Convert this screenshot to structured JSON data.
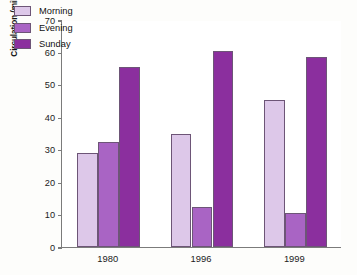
{
  "chart_data": {
    "type": "bar",
    "title": "",
    "subtitle": "",
    "xlabel": "",
    "ylabel": "Circulation (millions)",
    "categories": [
      "1980",
      "1996",
      "1999"
    ],
    "series": [
      {
        "name": "Morning",
        "color": "#ddc8e9",
        "values": [
          29.0,
          35.0,
          45.3
        ]
      },
      {
        "name": "Evening",
        "color": "#a964c4",
        "values": [
          32.5,
          12.3,
          10.5
        ]
      },
      {
        "name": "Sunday",
        "color": "#8b2f9e",
        "values": [
          55.5,
          60.3,
          58.6
        ]
      }
    ],
    "ylim": [
      0,
      70
    ],
    "ytick_step": 10,
    "ytick_labels": [
      "0",
      "10",
      "20",
      "30",
      "40",
      "50",
      "60",
      "70"
    ],
    "grid": false,
    "legend_position": "top-left-inside",
    "axis_color": "#7b7b7b",
    "bar_border_color": "#6d5577",
    "background_color": "#ffffff"
  }
}
